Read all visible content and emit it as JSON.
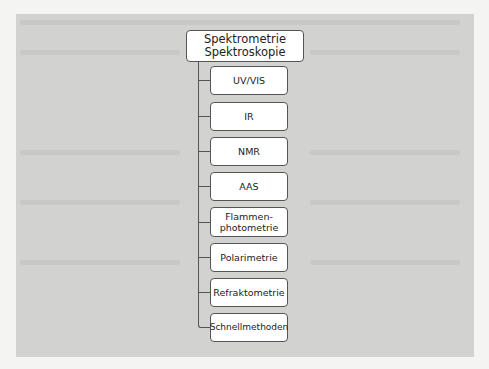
{
  "diagram": {
    "type": "tree",
    "root": {
      "label_lines": [
        "Spektrometrie",
        "Spektroskopie"
      ]
    },
    "children": [
      {
        "label_lines": [
          "UV/VIS"
        ]
      },
      {
        "label_lines": [
          "IR"
        ]
      },
      {
        "label_lines": [
          "NMR"
        ]
      },
      {
        "label_lines": [
          "AAS"
        ]
      },
      {
        "label_lines": [
          "Flammen-",
          "photometrie"
        ]
      },
      {
        "label_lines": [
          "Polarimetrie"
        ]
      },
      {
        "label_lines": [
          "Refraktometrie"
        ]
      },
      {
        "label_lines": [
          "Schnellmethoden"
        ]
      }
    ]
  },
  "colors": {
    "panel": "#d2d2d0",
    "box_fill": "#ffffff",
    "box_border": "#555555",
    "page": "#f4f4f2"
  }
}
